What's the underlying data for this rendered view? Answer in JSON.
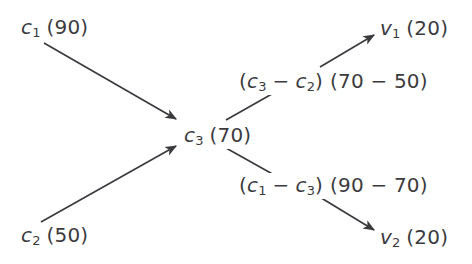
{
  "diagram": {
    "type": "flow-diagram",
    "background_color": "#ffffff",
    "ink_color": "#3b3b3e",
    "nodes": [
      {
        "id": "c1",
        "var": "c",
        "sub": "1",
        "value": "(90)",
        "text": "c1 (90)",
        "x": 21,
        "y": 17
      },
      {
        "id": "c2",
        "var": "c",
        "sub": "2",
        "value": "(50)",
        "text": "c2 (50)",
        "x": 21,
        "y": 225
      },
      {
        "id": "c3",
        "var": "c",
        "sub": "3",
        "value": "(70)",
        "text": "c3 (70)",
        "x": 181,
        "y": 123
      },
      {
        "id": "v1",
        "var": "v",
        "sub": "1",
        "value": "(20)",
        "text": "v1 (20)",
        "x": 377,
        "y": 16
      },
      {
        "id": "v2",
        "var": "v",
        "sub": "2",
        "value": "(20)",
        "text": "v2 (20)",
        "x": 377,
        "y": 225
      }
    ],
    "edge_labels": [
      {
        "id": "label-top",
        "text": "(c3 - c2) (70 - 50)",
        "expr_var_open": "(",
        "expr_var_a": "c",
        "expr_var_a_sub": "3",
        "expr_op": "−",
        "expr_var_b": "c",
        "expr_var_b_sub": "2",
        "expr_var_close": ")",
        "expr_num": "(70 − 50)",
        "x": 236,
        "y": 69
      },
      {
        "id": "label-bottom",
        "text": "(c1 - c3) (90 - 70)",
        "expr_var_open": "(",
        "expr_var_a": "c",
        "expr_var_a_sub": "1",
        "expr_op": "−",
        "expr_var_b": "c",
        "expr_var_b_sub": "3",
        "expr_var_close": ")",
        "expr_num": "(90 − 70)",
        "x": 236,
        "y": 173
      }
    ],
    "edges": [
      {
        "id": "edge-c1-c3",
        "from": "c1",
        "to": "c3",
        "arrowhead": true,
        "label": null
      },
      {
        "id": "edge-c2-c3",
        "from": "c2",
        "to": "c3",
        "arrowhead": true,
        "label": null
      },
      {
        "id": "edge-c3-v1",
        "from": "c3",
        "to": "v1",
        "arrowhead": true,
        "label": "label-top"
      },
      {
        "id": "edge-c3-v2",
        "from": "c3",
        "to": "v2",
        "arrowhead": true,
        "label": "label-bottom"
      }
    ]
  }
}
